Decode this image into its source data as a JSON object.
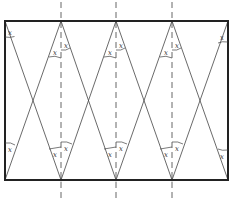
{
  "diagram": {
    "type": "geometric-figure",
    "angle_label": "x",
    "rectangle": {
      "left": 5,
      "top": 21,
      "right": 228,
      "bottom": 180
    },
    "vertices_x": [
      5,
      61,
      116,
      172,
      228
    ],
    "dashed_lines_x": [
      61,
      116,
      172
    ],
    "colors": {
      "stroke": "#333333",
      "frame": "#222222",
      "background": "#ffffff"
    }
  },
  "labels": {
    "tl_corner": "x",
    "tr_corner": "x",
    "bl_corner": "x",
    "br_corner": "x",
    "t1_left": "x",
    "t1_right": "x",
    "t2_left": "x",
    "t2_right": "x",
    "t3_left": "x",
    "t3_right": "x",
    "b1_left": "x",
    "b1_right": "x",
    "b2_left": "x",
    "b2_right": "x",
    "b3_left": "x",
    "b3_right": "x"
  }
}
